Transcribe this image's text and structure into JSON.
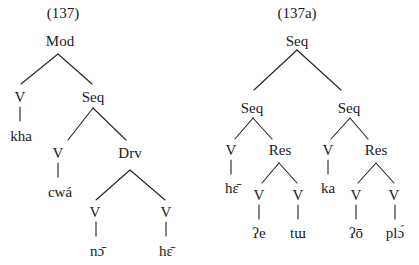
{
  "trees": [
    {
      "id": "left",
      "caption": "(137)",
      "caption_pos": [
        63,
        18
      ],
      "nodes": [
        {
          "id": "mod",
          "label": "Mod",
          "x": 60,
          "y": 46
        },
        {
          "id": "v1",
          "label": "V",
          "x": 20,
          "y": 102
        },
        {
          "id": "kha",
          "label": "kha",
          "x": 21,
          "y": 141
        },
        {
          "id": "seq1",
          "label": "Seq",
          "x": 93,
          "y": 102
        },
        {
          "id": "v2",
          "label": "V",
          "x": 58,
          "y": 158
        },
        {
          "id": "cwa",
          "label": "cwá",
          "x": 60,
          "y": 197
        },
        {
          "id": "drv",
          "label": "Drv",
          "x": 130,
          "y": 158
        },
        {
          "id": "v3",
          "label": "V",
          "x": 95,
          "y": 217
        },
        {
          "id": "no",
          "label": "nɔ̄",
          "x": 97,
          "y": 256
        },
        {
          "id": "v4",
          "label": "V",
          "x": 166,
          "y": 217
        },
        {
          "id": "he1",
          "label": "hɛ̄",
          "x": 166,
          "y": 256
        }
      ],
      "edges": [
        [
          58,
          54,
          21,
          84
        ],
        [
          58,
          54,
          92,
          84
        ],
        [
          20,
          107,
          20,
          121
        ],
        [
          93,
          108,
          68,
          140
        ],
        [
          93,
          108,
          126,
          140
        ],
        [
          58,
          163,
          58,
          177
        ],
        [
          130,
          170,
          96,
          200
        ],
        [
          130,
          170,
          165,
          200
        ],
        [
          96,
          222,
          96,
          236
        ],
        [
          166,
          222,
          166,
          236
        ]
      ]
    },
    {
      "id": "right",
      "caption": "(137a)",
      "caption_pos": [
        297,
        18
      ],
      "nodes": [
        {
          "id": "seq_root",
          "label": "Seq",
          "x": 297,
          "y": 46
        },
        {
          "id": "seq_l",
          "label": "Seq",
          "x": 252,
          "y": 113
        },
        {
          "id": "v_he",
          "label": "V",
          "x": 231,
          "y": 155
        },
        {
          "id": "he2",
          "label": "hɛ̄",
          "x": 232,
          "y": 193
        },
        {
          "id": "res_l",
          "label": "Res",
          "x": 280,
          "y": 155
        },
        {
          "id": "v_e",
          "label": "V",
          "x": 259,
          "y": 200
        },
        {
          "id": "glottal_e",
          "label": "ʔe",
          "x": 259,
          "y": 238
        },
        {
          "id": "v_tu",
          "label": "V",
          "x": 298,
          "y": 200
        },
        {
          "id": "tu",
          "label": "tɯ",
          "x": 298,
          "y": 238
        },
        {
          "id": "seq_r",
          "label": "Seq",
          "x": 349,
          "y": 113
        },
        {
          "id": "v_ka",
          "label": "V",
          "x": 328,
          "y": 155
        },
        {
          "id": "ka",
          "label": "ka",
          "x": 328,
          "y": 193
        },
        {
          "id": "res_r",
          "label": "Res",
          "x": 376,
          "y": 155
        },
        {
          "id": "v_o",
          "label": "V",
          "x": 356,
          "y": 200
        },
        {
          "id": "glottal_o",
          "label": "ʔō",
          "x": 356,
          "y": 238
        },
        {
          "id": "v_plo",
          "label": "V",
          "x": 394,
          "y": 200
        },
        {
          "id": "plo",
          "label": "plɔ́",
          "x": 395,
          "y": 238
        }
      ],
      "edges": [
        [
          297,
          50,
          254,
          90
        ],
        [
          297,
          50,
          341,
          90
        ],
        [
          253,
          118,
          235,
          139
        ],
        [
          253,
          118,
          272,
          139
        ],
        [
          231,
          160,
          231,
          174
        ],
        [
          279,
          163,
          262,
          183
        ],
        [
          279,
          163,
          297,
          183
        ],
        [
          259,
          205,
          259,
          219
        ],
        [
          298,
          205,
          298,
          219
        ],
        [
          350,
          118,
          331,
          139
        ],
        [
          350,
          118,
          368,
          139
        ],
        [
          328,
          160,
          328,
          174
        ],
        [
          376,
          163,
          358,
          183
        ],
        [
          376,
          163,
          394,
          183
        ],
        [
          356,
          205,
          356,
          219
        ],
        [
          395,
          205,
          395,
          219
        ]
      ]
    }
  ],
  "top_cut_text": {
    "visible": "partially cropped line of text at top edge"
  }
}
